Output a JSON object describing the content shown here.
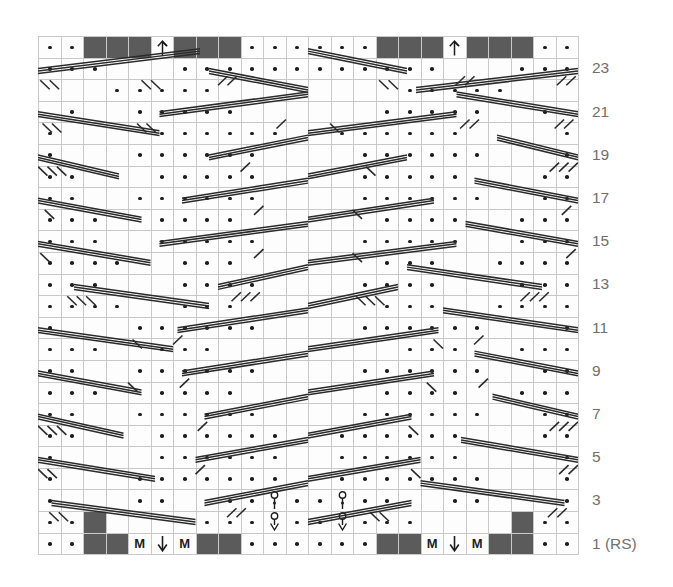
{
  "chart": {
    "type": "knitting-chart",
    "columns": 24,
    "rows": 24,
    "cell_width": 22.5,
    "cell_height": 21.6,
    "grid_origin": {
      "x": 38,
      "y": 36
    },
    "colors": {
      "grid_line": "#c9c9c9",
      "cell_background": "#fdfdfd",
      "dark_cell": "#5b5b5b",
      "symbol": "#1d1d1d",
      "cable_line": "#2b2b2b",
      "row_number": "#6f6f6f",
      "page_background": "#ffffff"
    },
    "row_labels": [
      {
        "row": 23,
        "text": "23"
      },
      {
        "row": 21,
        "text": "21"
      },
      {
        "row": 19,
        "text": "19"
      },
      {
        "row": 17,
        "text": "17"
      },
      {
        "row": 15,
        "text": "15"
      },
      {
        "row": 13,
        "text": "13"
      },
      {
        "row": 11,
        "text": "11"
      },
      {
        "row": 9,
        "text": "9"
      },
      {
        "row": 7,
        "text": "7"
      },
      {
        "row": 5,
        "text": "5"
      },
      {
        "row": 3,
        "text": "3"
      },
      {
        "row": 1,
        "text": "1 (RS)"
      }
    ],
    "symbol_legend": {
      "dot": "purl-stitch",
      "blank": "knit-stitch",
      "dark": "dark-block-stitch",
      "M": "make-one-increase",
      "arrow-up": "arrow-up-symbol",
      "arrow-down": "arrow-down-symbol",
      "yarn-over": "yarn-over-symbol",
      "cable-line": "traveling-stitch-cable"
    },
    "cells": [
      {
        "row": 24,
        "cells": ".. DDD ^ DDD ........ DDD ^ DDD .."
      },
      {
        "row": 23,
        "cells": "..    ..  . ...  .......  .  ..    .."
      },
      {
        "row": 22,
        "cells": "     ..... ........  .....      "
      },
      {
        "row": 21,
        "cells": " .   ..... ......  .....     ."
      },
      {
        "row": 20,
        "cells": ".    ...... ......    ........"
      },
      {
        "row": 19,
        "cells": ".  . ..... ......  .....   . ."
      },
      {
        "row": 18,
        "cells": "..   ..... ......  .....   .."
      },
      {
        "row": 17,
        "cells": ".. . ..... ......  ....  . .."
      },
      {
        "row": 16,
        "cells": "...  ..... ......  ....  ..."
      },
      {
        "row": 15,
        "cells": "... . .... ......  ...  . ..."
      },
      {
        "row": 14,
        "cells": "....  .... .....  ...  ...."
      },
      {
        "row": 13,
        "cells": "... . .... .....  ...  . ..."
      },
      {
        "row": 12,
        "cells": "....  .... ....  ...  ...."
      },
      {
        "row": 11,
        "cells": ". .  ..... ....  ....  . ."
      },
      {
        "row": 10,
        "cells": "...  ..... .....  ...  ..."
      },
      {
        "row": 9,
        "cells": ".. . ..... .....  ....  .."
      },
      {
        "row": 8,
        "cells": "...  ..... ......  ...  ..."
      },
      {
        "row": 7,
        "cells": ".. . ..... ......  ....  .."
      },
      {
        "row": 6,
        "cells": "..   ..... ......  .....  .."
      },
      {
        "row": 5,
        "cells": ". .  ..... ......  .....  . ."
      },
      {
        "row": 4,
        "cells": ".    ...... ......    ."
      },
      {
        "row": 3,
        "cells": ". .  ... O ...  ...  . ."
      },
      {
        "row": 2,
        "cells": ".. D   o V   D .. ..  .. D   o V   D .."
      },
      {
        "row": 1,
        "cells": ".. DD M V M DD ........ DD M V M DD .."
      }
    ],
    "specials": [
      {
        "row": 24,
        "col": 5,
        "symbol": "arrow-up",
        "name": "arrow-up-icon"
      },
      {
        "row": 24,
        "col": 18,
        "symbol": "arrow-up",
        "name": "arrow-up-icon"
      },
      {
        "row": 3,
        "col": 11,
        "symbol": "yarn-over",
        "name": "yarn-over-icon"
      },
      {
        "row": 3,
        "col": 12,
        "symbol": "yarn-over",
        "name": "yarn-over-icon"
      },
      {
        "row": 2,
        "col": 11,
        "symbol": "yarn-over-down",
        "name": "yarn-over-down-icon"
      },
      {
        "row": 2,
        "col": 12,
        "symbol": "yarn-over-down",
        "name": "yarn-over-down-icon"
      },
      {
        "row": 1,
        "col": 5,
        "symbol": "M",
        "name": "make-one-label"
      },
      {
        "row": 1,
        "col": 6,
        "symbol": "arrow-down",
        "name": "arrow-down-icon"
      },
      {
        "row": 1,
        "col": 7,
        "symbol": "M",
        "name": "make-one-label"
      },
      {
        "row": 1,
        "col": 18,
        "symbol": "M",
        "name": "make-one-label"
      },
      {
        "row": 1,
        "col": 19,
        "symbol": "arrow-down",
        "name": "arrow-down-icon"
      },
      {
        "row": 1,
        "col": 20,
        "symbol": "M",
        "name": "make-one-label"
      }
    ]
  }
}
